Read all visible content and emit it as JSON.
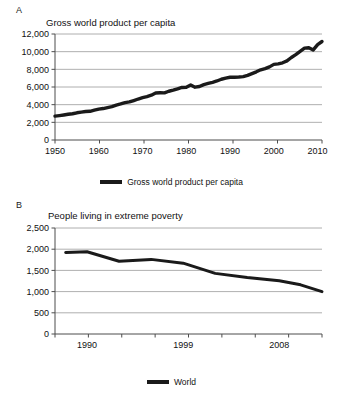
{
  "figure": {
    "panels": [
      {
        "letter": "A",
        "title": "Gross world product per capita",
        "legend_label": "Gross world product per capita"
      },
      {
        "letter": "B",
        "title": "People living in extreme poverty",
        "legend_label": "World"
      }
    ],
    "series_color": "#1a1a1a",
    "grid_color": "#9a9a9a",
    "axis_color": "#4d4d4d"
  },
  "chart_data": [
    {
      "type": "line",
      "title": "Gross world product per capita",
      "xlabel": "",
      "ylabel": "",
      "xlim": [
        1950,
        2011
      ],
      "ylim": [
        0,
        12000
      ],
      "xticks": [
        1950,
        1960,
        1970,
        1980,
        1990,
        2000,
        2010
      ],
      "xticklabels": [
        "1950",
        "1960",
        "1970",
        "1980",
        "1990",
        "2000",
        "2010"
      ],
      "yticks": [
        0,
        2000,
        4000,
        6000,
        8000,
        10000,
        12000
      ],
      "yticklabels": [
        "0",
        "2,000",
        "4,000",
        "6,000",
        "8,000",
        "10,000",
        "12,000"
      ],
      "grid": "horizontal",
      "legend": [
        "Gross world product per capita"
      ],
      "legend_position": "bottom-center",
      "series": [
        {
          "name": "Gross world product per capita",
          "x": [
            1950,
            1951,
            1952,
            1953,
            1954,
            1955,
            1956,
            1957,
            1958,
            1959,
            1960,
            1961,
            1962,
            1963,
            1964,
            1965,
            1966,
            1967,
            1968,
            1969,
            1970,
            1971,
            1972,
            1973,
            1974,
            1975,
            1976,
            1977,
            1978,
            1979,
            1980,
            1981,
            1982,
            1983,
            1984,
            1985,
            1986,
            1987,
            1988,
            1989,
            1990,
            1991,
            1992,
            1993,
            1994,
            1995,
            1996,
            1997,
            1998,
            1999,
            2000,
            2001,
            2002,
            2003,
            2004,
            2005,
            2006,
            2007,
            2008,
            2009,
            2010,
            2011
          ],
          "y": [
            2700,
            2760,
            2830,
            2910,
            2970,
            3080,
            3160,
            3220,
            3250,
            3380,
            3500,
            3560,
            3670,
            3780,
            3950,
            4080,
            4230,
            4310,
            4470,
            4640,
            4790,
            4910,
            5070,
            5320,
            5350,
            5330,
            5520,
            5650,
            5800,
            5950,
            5980,
            6230,
            5980,
            6060,
            6270,
            6400,
            6530,
            6680,
            6880,
            7000,
            7100,
            7110,
            7130,
            7180,
            7320,
            7520,
            7720,
            7950,
            8080,
            8280,
            8560,
            8620,
            8740,
            8960,
            9340,
            9660,
            10030,
            10400,
            10450,
            10200,
            10800,
            11150
          ]
        }
      ]
    },
    {
      "type": "line",
      "title": "People living in extreme poverty",
      "xlabel": "",
      "ylabel": "",
      "xlim": [
        1987,
        2012
      ],
      "ylim": [
        0,
        2500
      ],
      "xticks": [
        1990,
        1999,
        2008
      ],
      "xticklabels": [
        "1990",
        "1999",
        "2008"
      ],
      "yticks": [
        0,
        500,
        1000,
        1500,
        2000,
        2500
      ],
      "yticklabels": [
        "0",
        "500",
        "1,000",
        "1,500",
        "2,000",
        "2,500"
      ],
      "grid": "horizontal",
      "legend": [
        "World"
      ],
      "legend_position": "bottom-center",
      "series": [
        {
          "name": "World",
          "x": [
            1988,
            1990,
            1993,
            1996,
            1999,
            2002,
            2005,
            2008,
            2010,
            2012
          ],
          "y": [
            1925,
            1940,
            1715,
            1760,
            1670,
            1430,
            1330,
            1255,
            1160,
            1000
          ]
        }
      ]
    }
  ]
}
